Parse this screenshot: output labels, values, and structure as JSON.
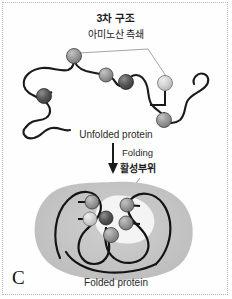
{
  "figure": {
    "panel_letter": "C",
    "frame_color": "#b9b9b9",
    "background": "#ffffff"
  },
  "labels": {
    "tertiary_structure": "3차 구조",
    "amino_acid_side_chain": "아미노산 측쇄",
    "unfolded_protein": "Unfolded protein",
    "folding": "Folding",
    "active_site": "활성부위",
    "folded_protein": "Folded protein"
  },
  "colors": {
    "chain_stroke": "#1a1a1a",
    "blob_fill": "#c6c6c6",
    "cleft_fill": "#f2f2f2",
    "leader_line": "#8c8c8c",
    "text": "#1c1c1c",
    "sphere_dark": "#4a4a4a",
    "sphere_mid": "#8e8e8e",
    "sphere_light": "#c9c9c9"
  },
  "unfolded_spheres": [
    {
      "id": "sphere-u1",
      "cx": 74,
      "cy": 56,
      "r": 7.5,
      "shade": "mid"
    },
    {
      "id": "sphere-u2",
      "cx": 44,
      "cy": 96,
      "r": 7.5,
      "shade": "dark"
    },
    {
      "id": "sphere-u3",
      "cx": 106,
      "cy": 75,
      "r": 7.0,
      "shade": "mid"
    },
    {
      "id": "sphere-u4",
      "cx": 126,
      "cy": 82,
      "r": 7.5,
      "shade": "dark"
    },
    {
      "id": "sphere-u5",
      "cx": 165,
      "cy": 83,
      "r": 7.5,
      "shade": "light"
    },
    {
      "id": "sphere-u6",
      "cx": 164,
      "cy": 120,
      "r": 7.5,
      "shade": "mid"
    }
  ],
  "folded_spheres": [
    {
      "id": "sphere-f1",
      "cx": 92,
      "cy": 202,
      "r": 7.0,
      "shade": "mid"
    },
    {
      "id": "sphere-f2",
      "cx": 90,
      "cy": 219,
      "r": 7.0,
      "shade": "light"
    },
    {
      "id": "sphere-f3",
      "cx": 106,
      "cy": 218,
      "r": 7.0,
      "shade": "dark"
    },
    {
      "id": "sphere-f4",
      "cx": 111,
      "cy": 235,
      "r": 7.5,
      "shade": "mid"
    },
    {
      "id": "sphere-f5",
      "cx": 127,
      "cy": 205,
      "r": 7.0,
      "shade": "mid"
    },
    {
      "id": "sphere-f6",
      "cx": 126,
      "cy": 223,
      "r": 7.0,
      "shade": "mid"
    }
  ],
  "arrow": {
    "name": "folding-arrow",
    "x": 113,
    "y_top": 143,
    "y_bottom": 172
  }
}
